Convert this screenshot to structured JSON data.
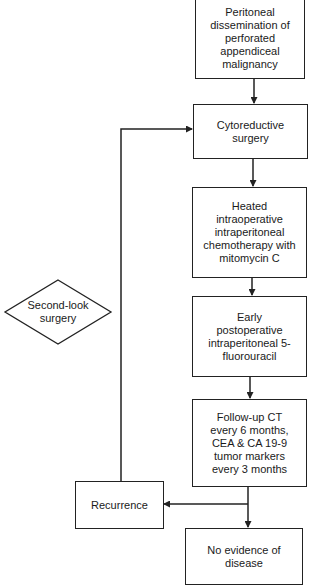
{
  "diagram": {
    "type": "flowchart",
    "nodes": [
      {
        "id": "peritoneal",
        "shape": "rectangle",
        "lines": [
          "Peritoneal",
          "dissemination of",
          "perforated",
          "appendiceal",
          "malignancy"
        ]
      },
      {
        "id": "cytoreductive",
        "shape": "rectangle",
        "lines": [
          "Cytoreductive",
          "surgery"
        ]
      },
      {
        "id": "hipec",
        "shape": "rectangle",
        "lines": [
          "Heated",
          "intraoperative",
          "intraperitoneal",
          "chemotherapy with",
          "mitomycin C"
        ]
      },
      {
        "id": "epic",
        "shape": "rectangle",
        "lines": [
          "Early",
          "postoperative",
          "intraperitoneal 5-",
          "fluorouracil"
        ]
      },
      {
        "id": "followup",
        "shape": "rectangle",
        "lines": [
          "Follow-up CT",
          "every 6 months,",
          "CEA & CA 19-9",
          "tumor markers",
          "every 3 months"
        ]
      },
      {
        "id": "recurrence",
        "shape": "rectangle",
        "lines": [
          "Recurrence"
        ]
      },
      {
        "id": "ned",
        "shape": "rectangle",
        "lines": [
          "No evidence of",
          "disease"
        ]
      },
      {
        "id": "second_look",
        "shape": "diamond",
        "lines": [
          "Second-look",
          "surgery"
        ]
      }
    ],
    "edges": [
      {
        "from": "peritoneal",
        "to": "cytoreductive"
      },
      {
        "from": "cytoreductive",
        "to": "hipec"
      },
      {
        "from": "hipec",
        "to": "epic"
      },
      {
        "from": "epic",
        "to": "followup"
      },
      {
        "from": "followup",
        "to": "ned"
      },
      {
        "from": "followup",
        "to": "recurrence"
      },
      {
        "from": "recurrence",
        "to": "cytoreductive"
      }
    ]
  }
}
